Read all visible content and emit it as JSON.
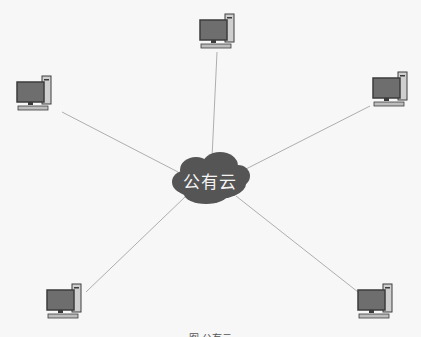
{
  "diagram": {
    "type": "star network topology",
    "center": {
      "label": "公有云",
      "shape": "cloud",
      "x": 210,
      "y": 180
    },
    "nodes": [
      {
        "id": "pc-top",
        "label": "",
        "icon": "desktop-computer-icon",
        "x": 200,
        "y": 14
      },
      {
        "id": "pc-left",
        "label": "",
        "icon": "desktop-computer-icon",
        "x": 16,
        "y": 76
      },
      {
        "id": "pc-right",
        "label": "",
        "icon": "desktop-computer-icon",
        "x": 370,
        "y": 72
      },
      {
        "id": "pc-bottom-left",
        "label": "",
        "icon": "desktop-computer-icon",
        "x": 46,
        "y": 286
      },
      {
        "id": "pc-bottom-right",
        "label": "",
        "icon": "desktop-computer-icon",
        "x": 355,
        "y": 286
      }
    ],
    "edges": [
      {
        "from": "公有云",
        "to": "pc-top"
      },
      {
        "from": "公有云",
        "to": "pc-left"
      },
      {
        "from": "公有云",
        "to": "pc-right"
      },
      {
        "from": "公有云",
        "to": "pc-bottom-left"
      },
      {
        "from": "公有云",
        "to": "pc-bottom-right"
      }
    ],
    "caption": "图 公有云"
  },
  "colors": {
    "background": "#f7f7f7",
    "cloud_fill": "#555555",
    "cloud_text": "#f4f4f4",
    "line": "#9a9a9a",
    "monitor_screen": "#6e6e6e",
    "monitor_frame": "#3c3c3c"
  }
}
